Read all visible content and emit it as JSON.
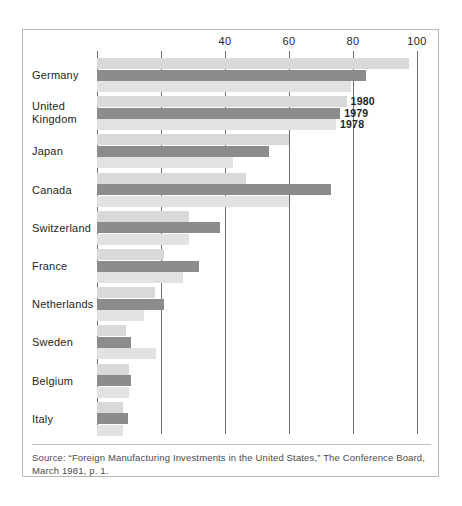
{
  "chart_data": {
    "type": "bar",
    "orientation": "horizontal",
    "title": "",
    "subtitle": "",
    "xlabel": "",
    "ylabel": "",
    "xlim": [
      0,
      100
    ],
    "grid": true,
    "gridlines": [
      0,
      20,
      40,
      60,
      80,
      100
    ],
    "tick_labels": [
      "",
      "",
      "40",
      "60",
      "80",
      "100"
    ],
    "legend_position": "inline-right-of-united-kingdom-bars",
    "categories": [
      "Germany",
      "United\nKingdom",
      "Japan",
      "Canada",
      "Switzerland",
      "France",
      "Netherlands",
      "Sweden",
      "Belgium",
      "Italy"
    ],
    "series": [
      {
        "name": "1980",
        "color": "#d9d9d9",
        "values": [
          97.5,
          78.0,
          60.0,
          46.5,
          28.8,
          21.0,
          18.0,
          9.0,
          10.0,
          8.0
        ]
      },
      {
        "name": "1979",
        "color": "#8c8c8c",
        "values": [
          84.0,
          76.0,
          53.8,
          73.0,
          38.4,
          32.0,
          21.0,
          10.6,
          10.6,
          9.7
        ]
      },
      {
        "name": "1978",
        "color": "#e2e2e2",
        "values": [
          79.4,
          74.7,
          42.5,
          60.0,
          28.8,
          27.0,
          14.7,
          18.4,
          10.0,
          8.0
        ]
      }
    ],
    "annotations": [
      "1980",
      "1979",
      "1978"
    ]
  },
  "source": {
    "line1": "Source: “Foreign Manufacturing Investments in the United States,” The Conference Board,",
    "line2": "March 1981, p. 1."
  }
}
